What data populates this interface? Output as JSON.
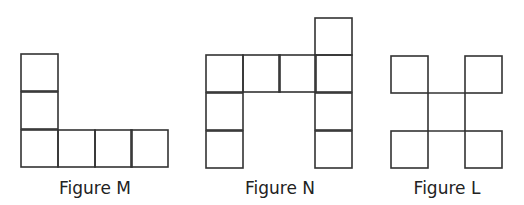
{
  "figures": [
    {
      "id": "M",
      "caption": "Figure M",
      "caption_x": 95,
      "square_size": 37,
      "squares": [
        [
          21,
          54
        ],
        [
          21,
          92
        ],
        [
          21,
          130
        ],
        [
          58,
          130
        ],
        [
          95,
          130
        ],
        [
          131,
          130
        ]
      ]
    },
    {
      "id": "N",
      "caption": "Figure N",
      "caption_x": 280,
      "square_size": 37,
      "squares": [
        [
          315,
          18
        ],
        [
          206,
          55
        ],
        [
          243,
          55
        ],
        [
          279,
          55
        ],
        [
          315,
          55
        ],
        [
          206,
          93
        ],
        [
          315,
          93
        ],
        [
          206,
          131
        ],
        [
          315,
          131
        ]
      ]
    },
    {
      "id": "L",
      "caption": "Figure L",
      "caption_x": 447,
      "square_size": 37,
      "squares": [
        [
          391,
          56
        ],
        [
          465,
          56
        ],
        [
          391,
          131
        ],
        [
          465,
          131
        ]
      ],
      "connector_lines": [
        [
          428,
          93,
          428,
          131
        ],
        [
          465,
          93,
          465,
          131
        ],
        [
          428,
          93,
          465,
          93
        ],
        [
          428,
          131,
          465,
          131
        ]
      ]
    }
  ],
  "colors": {
    "stroke": "#333333",
    "text": "#222222",
    "background": "#ffffff"
  }
}
